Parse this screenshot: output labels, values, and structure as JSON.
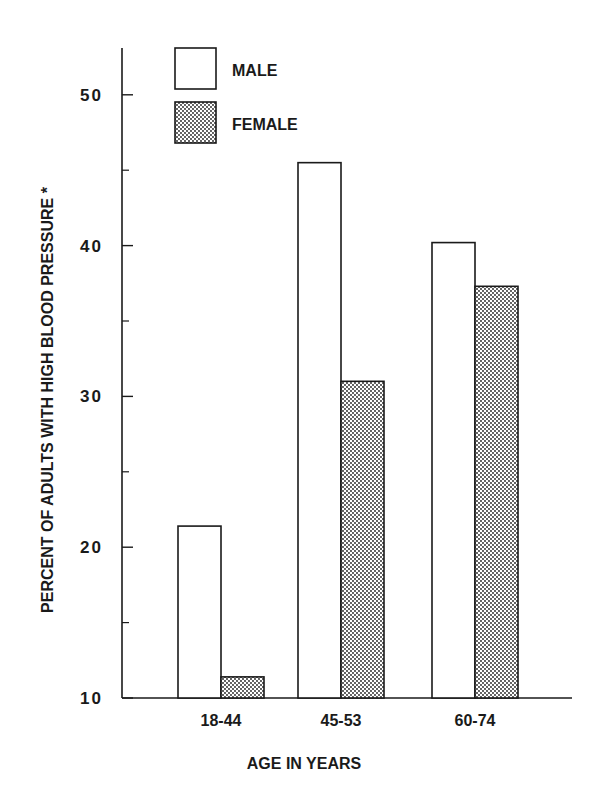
{
  "chart_data": {
    "type": "bar",
    "title": "",
    "xlabel": "AGE IN YEARS",
    "ylabel": "PERCENT OF ADULTS WITH HIGH BLOOD PRESSURE *",
    "ylim": [
      10,
      53
    ],
    "yticks": [
      10,
      20,
      30,
      40,
      50
    ],
    "yminor_ticks": [
      15,
      25,
      35,
      45
    ],
    "grid": false,
    "legend_position": "top-left",
    "categories": [
      "18-44",
      "45-53",
      "60-74"
    ],
    "series": [
      {
        "name": "MALE",
        "fill": "hollow",
        "values": [
          21.4,
          45.5,
          40.2
        ]
      },
      {
        "name": "FEMALE",
        "fill": "stippled",
        "values": [
          11.4,
          31.0,
          37.3
        ]
      }
    ]
  },
  "colors": {
    "ink": "#1a1a1a",
    "male_fill": "#ffffff",
    "female_fill": "#bfbfbf"
  }
}
